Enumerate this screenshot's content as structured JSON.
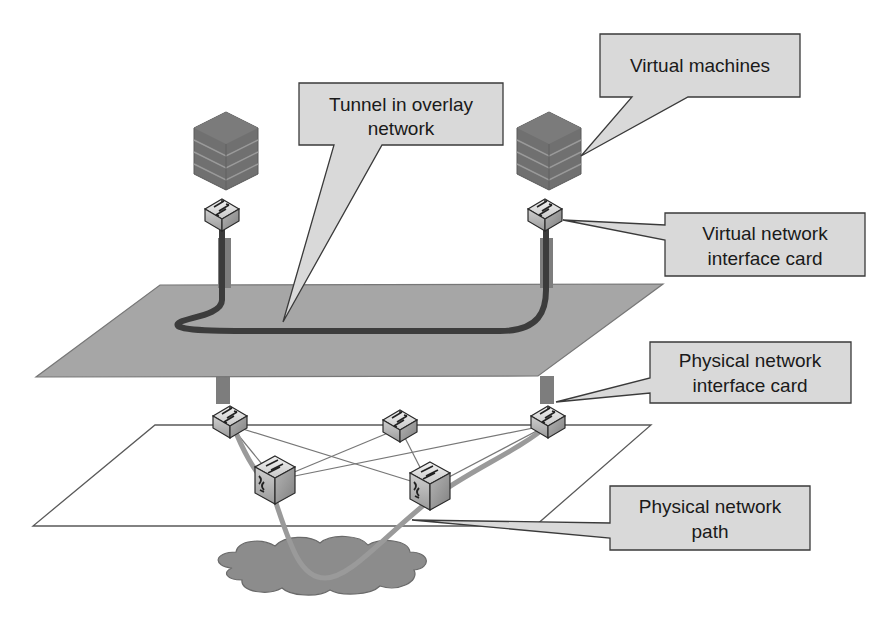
{
  "diagram": {
    "type": "overlay-network-diagram",
    "callouts": [
      {
        "id": "tunnel",
        "lines": [
          "Tunnel in overlay",
          "network"
        ]
      },
      {
        "id": "vms",
        "lines": [
          "Virtual machines"
        ]
      },
      {
        "id": "vnic",
        "lines": [
          "Virtual network",
          "interface card"
        ]
      },
      {
        "id": "pnic",
        "lines": [
          "Physical network",
          "interface card"
        ]
      },
      {
        "id": "path",
        "lines": [
          "Physical network",
          "path"
        ]
      }
    ],
    "nodes": {
      "vm_stacks": [
        "left-vm-stack",
        "right-vm-stack"
      ],
      "virtual_switches": [
        "left-vnic",
        "right-vnic"
      ],
      "physical_switches": [
        "left-pnic",
        "middle-switch",
        "right-pnic",
        "lower-left-switch",
        "lower-right-switch"
      ],
      "cloud": "underlay-cloud"
    },
    "colors": {
      "overlay_plane": "#a6a6a6",
      "callout_fill": "#d9d9d9",
      "callout_border": "#3a3a3a",
      "tunnel": "#3c3c3c",
      "physical_path": "#9a9a9a",
      "vm_stack": "#6e6e6e",
      "cloud": "#8c8c8c"
    }
  }
}
